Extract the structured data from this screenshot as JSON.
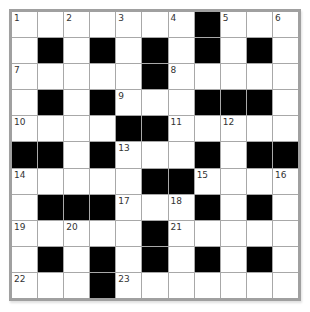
{
  "puzzle": {
    "rows": 11,
    "cols": 11,
    "colors": {
      "block": "#000000",
      "cell": "#ffffff",
      "border": "#a0a0a0",
      "number": "#333333"
    },
    "grid": [
      [
        "1",
        "",
        "2",
        "",
        "3",
        "",
        "4",
        "#",
        "5",
        "",
        "6"
      ],
      [
        "",
        "#",
        "",
        "#",
        "",
        "#",
        "",
        "#",
        "",
        "#",
        ""
      ],
      [
        "7",
        "",
        "",
        "",
        "",
        "#",
        "8",
        "",
        "",
        "",
        ""
      ],
      [
        "",
        "#",
        "",
        "#",
        "9",
        "",
        "",
        "#",
        "#",
        "#",
        ""
      ],
      [
        "10",
        "",
        "",
        "",
        "#",
        "#",
        "11",
        "",
        "12",
        "",
        ""
      ],
      [
        "#",
        "#",
        "",
        "#",
        "13",
        "",
        "",
        "#",
        "",
        "#",
        "#"
      ],
      [
        "14",
        "",
        "",
        "",
        "",
        "#",
        "#",
        "15",
        "",
        "",
        "16"
      ],
      [
        "",
        "#",
        "#",
        "#",
        "17",
        "",
        "18",
        "#",
        "",
        "#",
        ""
      ],
      [
        "19",
        "",
        "20",
        "",
        "",
        "#",
        "21",
        "",
        "",
        "",
        ""
      ],
      [
        "",
        "#",
        "",
        "#",
        "",
        "#",
        "",
        "#",
        "",
        "#",
        ""
      ],
      [
        "22",
        "",
        "",
        "#",
        "23",
        "",
        "",
        "",
        "",
        "",
        ""
      ]
    ]
  }
}
